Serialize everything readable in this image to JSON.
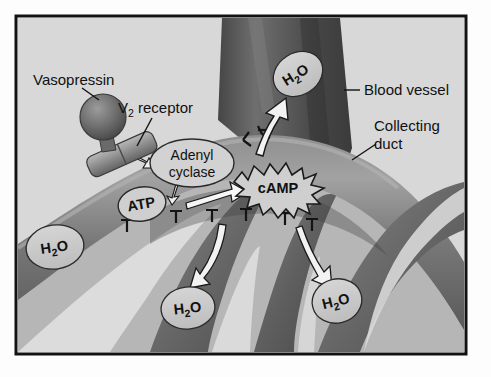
{
  "figure": {
    "frame": {
      "border_color": "#121212",
      "background_color": "#d8d8d8",
      "outer_margin_color": "#ffffff"
    },
    "palette": {
      "blood_vessel_dark": "#4a4a4a",
      "blood_vessel_mid": "#5e5e5e",
      "blood_vessel_light": "#6e6e6e",
      "duct_dark": "#565656",
      "duct_mid": "#7d7d7d",
      "duct_light": "#9a9a9a",
      "bubble_fill": "#c9c9c9",
      "gap_fill": "#dcdcdc",
      "arrow_white": "#f2f2f2",
      "outline": "#1a1a1a",
      "text": "#111111"
    },
    "callouts": [
      {
        "name": "vasopressin",
        "text": "Vasopressin",
        "x": 33,
        "y": 80
      },
      {
        "name": "v2-receptor",
        "text": "receptor",
        "prefix": "V",
        "subscript": "2",
        "x": 118,
        "y": 108
      },
      {
        "name": "blood-vessel",
        "text": "Blood vessel",
        "x": 363,
        "y": 95
      },
      {
        "name": "collecting-duct",
        "line1": "Collecting",
        "line2": "duct",
        "x": 374,
        "y": 132
      }
    ],
    "enzyme": {
      "name": "adenyl-cyclase",
      "line1": "Adenyl",
      "line2": "cyclase"
    },
    "second_messenger": {
      "name": "cAMP",
      "text": "cAMP"
    },
    "substrate": {
      "name": "ATP",
      "text": "ATP"
    },
    "water_molecules": [
      {
        "id": "water-vessel-top",
        "formula": "H",
        "sub": "2",
        "tail": "O",
        "x": 298,
        "y": 74,
        "rx": 26,
        "ry": 21,
        "rotate": -32
      },
      {
        "id": "water-duct-left",
        "formula": "H",
        "sub": "2",
        "tail": "O",
        "x": 55,
        "y": 247,
        "rx": 29,
        "ry": 22,
        "rotate": -8
      },
      {
        "id": "water-bottom-left",
        "formula": "H",
        "sub": "2",
        "tail": "O",
        "x": 188,
        "y": 308,
        "rx": 27,
        "ry": 21,
        "rotate": -6
      },
      {
        "id": "water-bottom-right",
        "formula": "H",
        "sub": "2",
        "tail": "O",
        "x": 337,
        "y": 301,
        "rx": 25,
        "ry": 22,
        "rotate": -14
      }
    ],
    "arrows": {
      "water_into_vessel": "upward white arrow from duct lumen into blood vessel",
      "atp_to_camp": "white arrow from ATP to cAMP",
      "camp_to_water_left": "curved white arrow down-left",
      "camp_to_water_right": "curved white arrow down-right",
      "membrane_channels": "T-shaped aquaporin channel markers along duct wall"
    }
  }
}
